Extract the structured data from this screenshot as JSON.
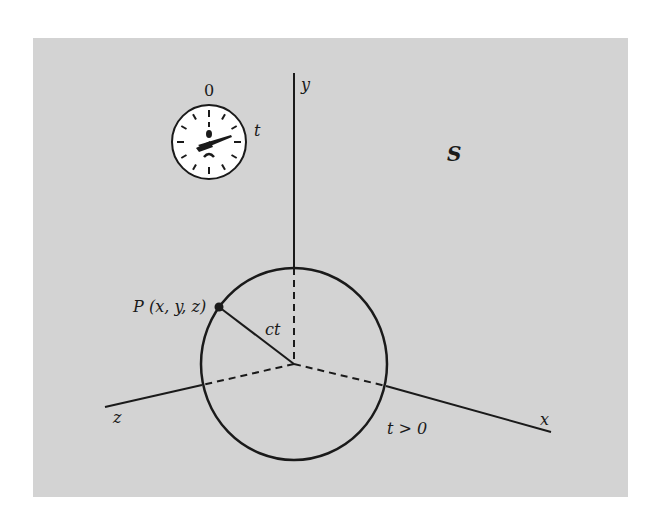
{
  "figure": {
    "frame_label": "S",
    "colors": {
      "panel": "#d3d3d3",
      "ink": "#1a1a1a",
      "clock_face": "#ffffff"
    },
    "clock": {
      "top_label": "0",
      "side_label": "t"
    },
    "axes": {
      "x_label": "x",
      "y_label": "y",
      "z_label": "z"
    },
    "point": {
      "name": "P",
      "coords": "(x, y, z)"
    },
    "radius_label": "ct",
    "condition_label": "t > 0"
  }
}
